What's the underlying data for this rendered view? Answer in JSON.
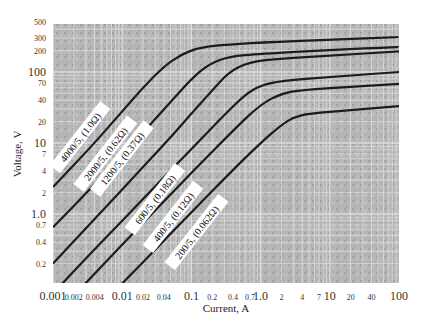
{
  "chart_data": {
    "type": "line",
    "title": "",
    "xlabel": "Current, A",
    "ylabel": "Voltage, V",
    "xscale": "log",
    "yscale": "log",
    "xlim": [
      0.001,
      100
    ],
    "ylim": [
      0.1,
      500
    ],
    "grid": true,
    "legend": "inline labels along curves",
    "x_ticks": [
      {
        "v": 0.001,
        "label": "0.001",
        "major": true
      },
      {
        "v": 0.002,
        "label": "0.002",
        "major": false
      },
      {
        "v": 0.004,
        "label": "0.004",
        "major": false
      },
      {
        "v": 0.01,
        "label": "0.01",
        "major": true
      },
      {
        "v": 0.02,
        "label": "0.02",
        "major": false
      },
      {
        "v": 0.04,
        "label": "0.04",
        "major": false
      },
      {
        "v": 0.1,
        "label": "0.1",
        "major": true
      },
      {
        "v": 0.2,
        "label": "0.2",
        "major": false
      },
      {
        "v": 0.4,
        "label": "0.4",
        "major": false
      },
      {
        "v": 0.7,
        "label": "0.7",
        "major": false
      },
      {
        "v": 1,
        "label": "1.0",
        "major": true
      },
      {
        "v": 2,
        "label": "2",
        "major": false
      },
      {
        "v": 4,
        "label": "4",
        "major": false
      },
      {
        "v": 7,
        "label": "7",
        "major": false
      },
      {
        "v": 10,
        "label": "10",
        "major": true
      },
      {
        "v": 20,
        "label": "20",
        "major": false
      },
      {
        "v": 40,
        "label": "40",
        "major": false
      },
      {
        "v": 100,
        "label": "100",
        "major": true
      }
    ],
    "y_ticks": [
      {
        "v": 500,
        "label": "500",
        "major": false
      },
      {
        "v": 300,
        "label": "300",
        "major": false
      },
      {
        "v": 200,
        "label": "200",
        "major": false
      },
      {
        "v": 100,
        "label": "100",
        "major": true
      },
      {
        "v": 70,
        "label": "70",
        "major": false
      },
      {
        "v": 40,
        "label": "40",
        "major": false
      },
      {
        "v": 20,
        "label": "20",
        "major": false
      },
      {
        "v": 10,
        "label": "10",
        "major": true
      },
      {
        "v": 7,
        "label": "7",
        "major": false
      },
      {
        "v": 4,
        "label": "4",
        "major": false
      },
      {
        "v": 2,
        "label": "2",
        "major": false
      },
      {
        "v": 1,
        "label": "1.0",
        "major": true
      },
      {
        "v": 0.7,
        "label": "0.7",
        "major": false
      },
      {
        "v": 0.4,
        "label": "0.4",
        "major": false
      },
      {
        "v": 0.2,
        "label": "0.2",
        "major": false
      }
    ],
    "series": [
      {
        "name": "4000/5, (1.0Ω)",
        "label_pos": {
          "x": 0.0025,
          "y": 12
        },
        "points": [
          [
            0.001,
            2.4
          ],
          [
            0.004,
            10
          ],
          [
            0.01,
            28
          ],
          [
            0.02,
            60
          ],
          [
            0.04,
            120
          ],
          [
            0.07,
            175
          ],
          [
            0.12,
            215
          ],
          [
            0.25,
            240
          ],
          [
            1,
            260
          ],
          [
            10,
            285
          ],
          [
            100,
            310
          ]
        ]
      },
      {
        "name": "2000/5, (0.62Ω)",
        "label_pos": {
          "x": 0.0058,
          "y": 7
        },
        "points": [
          [
            0.001,
            0.65
          ],
          [
            0.004,
            2.6
          ],
          [
            0.01,
            7
          ],
          [
            0.02,
            14
          ],
          [
            0.05,
            38
          ],
          [
            0.1,
            80
          ],
          [
            0.18,
            130
          ],
          [
            0.35,
            165
          ],
          [
            1,
            180
          ],
          [
            10,
            205
          ],
          [
            100,
            225
          ]
        ]
      },
      {
        "name": "1200/5, (0.37Ω)",
        "label_pos": {
          "x": 0.01,
          "y": 6
        },
        "points": [
          [
            0.001,
            0.2
          ],
          [
            0.004,
            0.85
          ],
          [
            0.01,
            2.2
          ],
          [
            0.02,
            4.6
          ],
          [
            0.05,
            12
          ],
          [
            0.1,
            26
          ],
          [
            0.2,
            55
          ],
          [
            0.35,
            100
          ],
          [
            0.7,
            140
          ],
          [
            2,
            155
          ],
          [
            10,
            170
          ],
          [
            100,
            195
          ]
        ]
      },
      {
        "name": "600/5, (0.18Ω)",
        "label_pos": {
          "x": 0.03,
          "y": 1.6
        },
        "points": [
          [
            0.0013,
            0.1
          ],
          [
            0.004,
            0.32
          ],
          [
            0.01,
            0.8
          ],
          [
            0.04,
            3.3
          ],
          [
            0.1,
            8.2
          ],
          [
            0.3,
            25
          ],
          [
            0.6,
            48
          ],
          [
            1,
            65
          ],
          [
            2,
            75
          ],
          [
            10,
            85
          ],
          [
            100,
            100
          ]
        ]
      },
      {
        "name": "400/5, (0.12Ω)",
        "label_pos": {
          "x": 0.055,
          "y": 0.9
        },
        "points": [
          [
            0.0028,
            0.1
          ],
          [
            0.01,
            0.37
          ],
          [
            0.04,
            1.5
          ],
          [
            0.1,
            3.8
          ],
          [
            0.4,
            15
          ],
          [
            1,
            35
          ],
          [
            2,
            50
          ],
          [
            4,
            56
          ],
          [
            20,
            62
          ],
          [
            100,
            68
          ]
        ]
      },
      {
        "name": "200/5, (0.062Ω)",
        "label_pos": {
          "x": 0.12,
          "y": 0.55
        },
        "points": [
          [
            0.0095,
            0.1
          ],
          [
            0.04,
            0.42
          ],
          [
            0.1,
            1.05
          ],
          [
            0.4,
            4.2
          ],
          [
            1,
            10
          ],
          [
            2,
            18
          ],
          [
            3,
            23
          ],
          [
            5,
            26
          ],
          [
            20,
            29
          ],
          [
            100,
            33
          ]
        ]
      }
    ]
  }
}
